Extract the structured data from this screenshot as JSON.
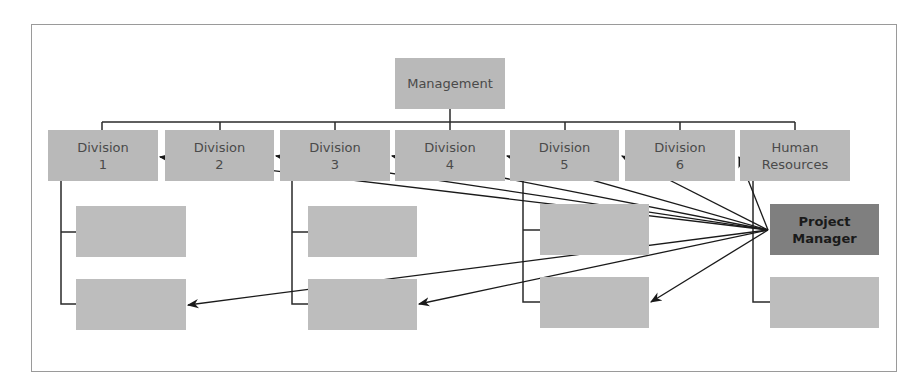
{
  "diagram": {
    "type": "org-chart-matrix",
    "root": {
      "label": "Management"
    },
    "divisions": [
      {
        "line1": "Division",
        "line2": "1"
      },
      {
        "line1": "Division",
        "line2": "2"
      },
      {
        "line1": "Division",
        "line2": "3"
      },
      {
        "line1": "Division",
        "line2": "4"
      },
      {
        "line1": "Division",
        "line2": "5"
      },
      {
        "line1": "Division",
        "line2": "6"
      },
      {
        "line1": "Human",
        "line2": "Resources"
      }
    ],
    "project_manager": {
      "line1": "Project",
      "line2": "Manager"
    },
    "sub_units": [
      {
        "column": "Division 1",
        "count": 2,
        "labels": [
          "",
          ""
        ]
      },
      {
        "column": "Division 3",
        "count": 2,
        "labels": [
          "",
          ""
        ]
      },
      {
        "column": "Division 5",
        "count": 2,
        "labels": [
          "",
          ""
        ]
      },
      {
        "column": "Human Resources",
        "count": 2,
        "labels": [
          "Project Manager",
          ""
        ]
      }
    ],
    "arrows_from": "Project Manager",
    "arrows_to": [
      "Division 1",
      "Division 2",
      "Division 3",
      "Division 4",
      "Division 5",
      "Division 6",
      "Human Resources",
      "Division 1 sub-unit 2",
      "Division 3 sub-unit 2",
      "Division 5 sub-unit 2"
    ],
    "colors": {
      "box_fill": "#b9b9b9",
      "highlight_fill": "#7f7f7f",
      "line": "#2a2a2a",
      "frame": "#9a9a9a"
    }
  }
}
